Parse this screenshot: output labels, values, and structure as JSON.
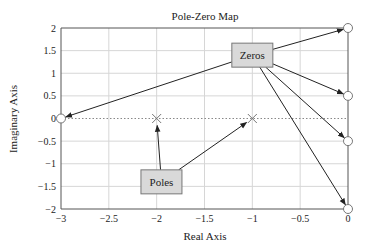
{
  "chart_data": {
    "type": "scatter",
    "title": "Pole-Zero Map",
    "xlabel": "Real Axis",
    "ylabel": "Imaginary Axis",
    "xlim": [
      -3,
      0
    ],
    "ylim": [
      -2,
      2
    ],
    "xticks": [
      -3,
      -2.5,
      -2,
      -1.5,
      -1,
      -0.5,
      0
    ],
    "xtick_labels": [
      "−3",
      "−2.5",
      "−2",
      "−1.5",
      "−1",
      "−0.5",
      "0"
    ],
    "yticks": [
      2,
      1.5,
      1,
      0.5,
      0,
      -0.5,
      -1,
      -1.5,
      -2
    ],
    "ytick_labels": [
      "2",
      "1.5",
      "1",
      "0.5",
      "0",
      "−0.5",
      "−1",
      "−1.5",
      "−2"
    ],
    "grid": true,
    "series": [
      {
        "name": "Poles",
        "marker": "x",
        "points": [
          [
            -2,
            0
          ],
          [
            -1,
            0
          ]
        ]
      },
      {
        "name": "Zeros",
        "marker": "o",
        "points": [
          [
            0,
            2
          ],
          [
            0,
            0.5
          ],
          [
            0,
            -0.5
          ],
          [
            0,
            -2
          ],
          [
            -3,
            0
          ]
        ]
      }
    ],
    "annotations": [
      {
        "label": "Zeros",
        "anchor": [
          -1.0,
          1.4
        ],
        "targets": [
          [
            0,
            2
          ],
          [
            0,
            0.5
          ],
          [
            0,
            -0.5
          ],
          [
            0,
            -2
          ],
          [
            -3,
            0
          ]
        ]
      },
      {
        "label": "Poles",
        "anchor": [
          -1.95,
          -1.4
        ],
        "targets": [
          [
            -2,
            0
          ],
          [
            -1,
            0
          ]
        ]
      }
    ]
  }
}
